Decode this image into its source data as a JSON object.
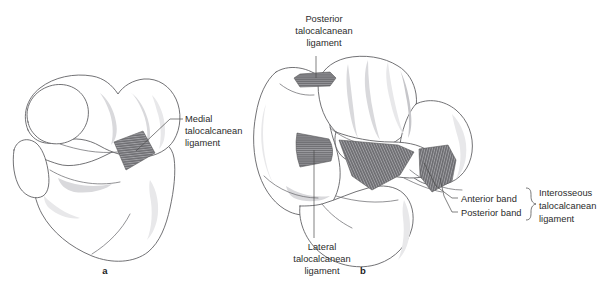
{
  "figure": {
    "background_color": "#ffffff",
    "ligament_fill_color": "#6e6e72",
    "bone_outline_color": "#59595c",
    "label_text_color": "#2b2b2b"
  },
  "panels": [
    {
      "id": "a",
      "letter": "a",
      "caption_letter_position": {
        "x": 105,
        "y": 274
      },
      "description": "Medial view of talus and calcaneus"
    },
    {
      "id": "b",
      "letter": "b",
      "caption_letter_position": {
        "x": 363,
        "y": 274
      },
      "description": "Posterior / superior view of talocalcaneal joint"
    }
  ],
  "labels": {
    "medial": {
      "lines": [
        "Medial",
        "talocalcanean",
        "ligament"
      ],
      "line1": "Medial",
      "line2": "talocalcanean",
      "line3": "ligament",
      "anchor": "start",
      "x": 185,
      "y": 122
    },
    "posterior": {
      "lines": [
        "Posterior",
        "talocalcanean",
        "ligament"
      ],
      "line1": "Posterior",
      "line2": "talocalcanean",
      "line3": "ligament",
      "anchor": "middle",
      "x": 324,
      "y": 22
    },
    "lateral": {
      "lines": [
        "Lateral",
        "talocalcanean",
        "ligament"
      ],
      "line1": "Lateral",
      "line2": "talocalcanean",
      "line3": "ligament",
      "anchor": "middle",
      "x": 322,
      "y": 250
    },
    "anterior_band": {
      "text": "Anterior band",
      "anchor": "start",
      "x": 461,
      "y": 202
    },
    "posterior_band": {
      "text": "Posterior band",
      "anchor": "start",
      "x": 461,
      "y": 216
    },
    "interosseous": {
      "lines": [
        "Interosseous",
        "talocalcanean",
        "ligament"
      ],
      "line1": "Interosseous",
      "line2": "talocalcanean",
      "line3": "ligament",
      "anchor": "start",
      "x": 539,
      "y": 196
    }
  },
  "ligaments": [
    {
      "name": "medial-talocalcanean-ligament",
      "panel": "a",
      "label_key": "medial",
      "shape": "parallelogram",
      "striation": "parallel"
    },
    {
      "name": "posterior-talocalcanean-ligament",
      "panel": "b",
      "label_key": "posterior",
      "shape": "band",
      "striation": "parallel"
    },
    {
      "name": "lateral-talocalcanean-ligament",
      "panel": "b",
      "label_key": "lateral",
      "shape": "quadrilateral",
      "striation": "parallel"
    },
    {
      "name": "interosseous-anterior-band",
      "panel": "b",
      "label_key": "anterior_band",
      "shape": "fan",
      "striation": "radiating"
    },
    {
      "name": "interosseous-posterior-band",
      "panel": "b",
      "label_key": "posterior_band",
      "shape": "fan",
      "striation": "radiating"
    }
  ]
}
